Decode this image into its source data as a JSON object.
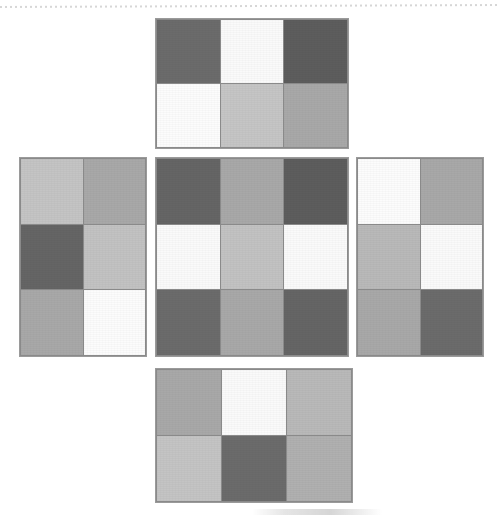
{
  "figure": {
    "layout": "cross-net",
    "panel_count": 5,
    "top_rule_style": "dotted",
    "background_color": "#ffffff",
    "separator_color": "#8a8a8a",
    "border_color": "#9a9a9a"
  },
  "chart_data": {
    "type": "heatmap",
    "title": "",
    "subtitle": "",
    "xlabel": "",
    "ylabel": "",
    "grid": true,
    "legend": "none",
    "value_scale": "grayscale 0-255",
    "panels": [
      {
        "name": "top",
        "rows": 2,
        "cols": 3,
        "values": [
          [
            107,
            250,
            93
          ],
          [
            252,
            197,
            168
          ]
        ],
        "colors": [
          [
            "#6b6b6b",
            "#fafafa",
            "#5d5d5d"
          ],
          [
            "#fcfcfc",
            "#c5c5c5",
            "#a8a8a8"
          ]
        ]
      },
      {
        "name": "left",
        "rows": 3,
        "cols": 2,
        "values": [
          [
            196,
            168
          ],
          [
            101,
            194
          ],
          [
            168,
            252
          ]
        ],
        "colors": [
          [
            "#c4c4c4",
            "#a8a8a8"
          ],
          [
            "#656565",
            "#c2c2c2"
          ],
          [
            "#a8a8a8",
            "#fcfcfc"
          ]
        ]
      },
      {
        "name": "center",
        "rows": 3,
        "cols": 3,
        "values": [
          [
            101,
            168,
            93
          ],
          [
            250,
            194,
            250
          ],
          [
            107,
            168,
            101
          ]
        ],
        "colors": [
          [
            "#656565",
            "#a8a8a8",
            "#5d5d5d"
          ],
          [
            "#fafafa",
            "#c2c2c2",
            "#fafafa"
          ],
          [
            "#6b6b6b",
            "#a8a8a8",
            "#656565"
          ]
        ]
      },
      {
        "name": "right",
        "rows": 3,
        "cols": 2,
        "values": [
          [
            252,
            168
          ],
          [
            185,
            250
          ],
          [
            168,
            107
          ]
        ],
        "colors": [
          [
            "#fcfcfc",
            "#a8a8a8"
          ],
          [
            "#b9b9b9",
            "#fafafa"
          ],
          [
            "#a8a8a8",
            "#6b6b6b"
          ]
        ]
      },
      {
        "name": "bottom",
        "rows": 2,
        "cols": 3,
        "values": [
          [
            168,
            250,
            185
          ],
          [
            196,
            107,
            176
          ]
        ],
        "colors": [
          [
            "#a8a8a8",
            "#fafafa",
            "#b9b9b9"
          ],
          [
            "#c4c4c4",
            "#6b6b6b",
            "#b0b0b0"
          ]
        ]
      }
    ]
  }
}
